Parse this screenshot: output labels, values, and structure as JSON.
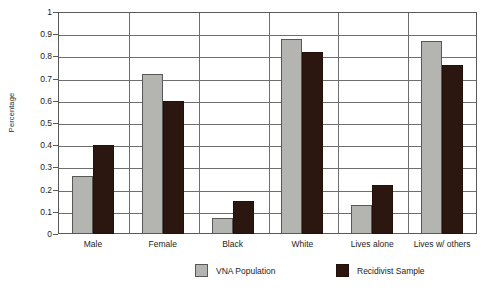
{
  "chart_data": {
    "type": "bar",
    "title": "",
    "xlabel": "",
    "ylabel": "Percentage",
    "ylim": [
      0,
      1
    ],
    "ytick_step": 0.1,
    "ytick_labels": [
      "1",
      "0.9",
      "0.8",
      "0.7",
      "0.6",
      "0.5",
      "0.4",
      "0.3",
      "0.2",
      "0.1",
      "0"
    ],
    "ytick_values": [
      1,
      0.9,
      0.8,
      0.7,
      0.6,
      0.5,
      0.4,
      0.3,
      0.2,
      0.1,
      0
    ],
    "grid": true,
    "grid_axis": "y",
    "legend_position": "bottom",
    "categories": [
      "Male",
      "Female",
      "Black",
      "White",
      "Lives alone",
      "Lives w/ others"
    ],
    "series": [
      {
        "name": "VNA Population",
        "color": "#b4b4b1",
        "values": [
          0.26,
          0.72,
          0.07,
          0.88,
          0.13,
          0.87
        ]
      },
      {
        "name": "Recidivist Sample",
        "color": "#2c1710",
        "values": [
          0.4,
          0.6,
          0.15,
          0.82,
          0.22,
          0.76
        ]
      }
    ]
  }
}
